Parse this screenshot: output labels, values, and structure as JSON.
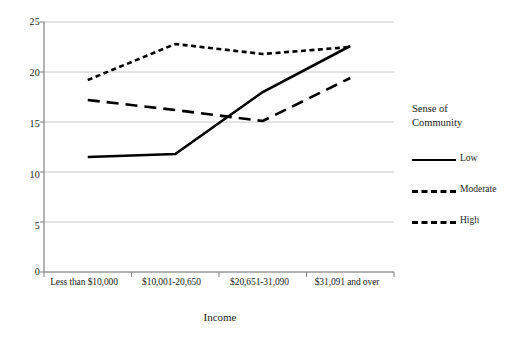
{
  "chart_data": {
    "type": "line",
    "title": "",
    "xlabel": "Income",
    "ylabel": "",
    "ylim": [
      0,
      25
    ],
    "yticks": [
      0,
      5,
      10,
      15,
      20,
      25
    ],
    "grid": true,
    "legend_position": "right",
    "legend_title": "Sense of Community",
    "legend_title_line1": "Sense of",
    "legend_title_line2": "Community",
    "categories": [
      "Less than $10,000",
      "$10,001-20,650",
      "$20,651-31,090",
      "$31,091 and over"
    ],
    "series": [
      {
        "name": "Low",
        "style": "solid",
        "values": [
          11.5,
          11.8,
          18.0,
          22.6
        ]
      },
      {
        "name": "Moderate",
        "style": "dashed",
        "values": [
          17.2,
          16.2,
          15.1,
          19.4
        ]
      },
      {
        "name": "High",
        "style": "dotted",
        "values": [
          19.2,
          22.8,
          21.8,
          22.5
        ]
      }
    ],
    "colors": {
      "line": "#000000",
      "grid": "#c8c8c8",
      "axis": "#808080",
      "text": "#1d1d1d",
      "background": "#ffffff"
    }
  },
  "axis": {
    "y_tick_labels": [
      "25",
      "20",
      "15",
      "10",
      "5",
      "0"
    ],
    "x_title": "Income"
  },
  "legend": {
    "title_line1": "Sense of",
    "title_line2": "Community",
    "items": [
      {
        "label": "Low",
        "style": "solid"
      },
      {
        "label": "Moderate",
        "style": "dashed"
      },
      {
        "label": "High",
        "style": "dotted"
      }
    ]
  }
}
